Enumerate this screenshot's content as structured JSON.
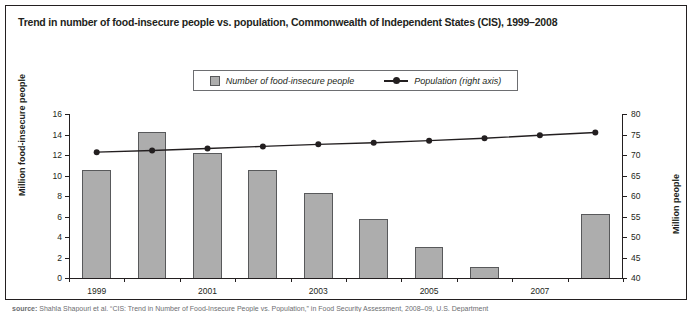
{
  "figure": {
    "title": "Trend in number of food-insecure people vs. population, Commonwealth of Independent States (CIS), 1999–2008",
    "source_prefix": "source:",
    "source_text": "Shahla Shapouri et al. “CIS: Trend in Number of Food-Insecure People vs. Population,” in Food Security Assessment, 2008–09, U.S. Department"
  },
  "legend": {
    "position": "top-center",
    "entries": [
      {
        "label": "Number of food-insecure people",
        "marker": "square-swatch",
        "color": "#adadad"
      },
      {
        "label": "Population (right axis)",
        "marker": "line-with-dot",
        "color": "#231f20"
      }
    ]
  },
  "axes": {
    "left": {
      "title": "Million food-insecure people",
      "ticks": [
        "0",
        "2",
        "4",
        "6",
        "8",
        "10",
        "12",
        "14",
        "16"
      ],
      "min": 0,
      "max": 16
    },
    "right": {
      "title": "Million people",
      "ticks": [
        "40",
        "45",
        "50",
        "55",
        "60",
        "65",
        "70",
        "75",
        "80"
      ],
      "min": 40,
      "max": 80
    },
    "x": {
      "tick_labels": [
        "1999",
        "2001",
        "2003",
        "2005",
        "2007"
      ]
    }
  },
  "chart_data": {
    "type": "bar",
    "title": "Trend in number of food-insecure people vs. population, Commonwealth of Independent States (CIS), 1999–2008",
    "xlabel": "",
    "ylabel": "Million food-insecure people",
    "y2label": "Million people",
    "ylim": [
      0,
      16
    ],
    "y2lim": [
      40,
      80
    ],
    "grid": false,
    "legend_position": "top-center",
    "categories": [
      "1999",
      "2000",
      "2001",
      "2002",
      "2003",
      "2004",
      "2005",
      "2006",
      "2007",
      "2008"
    ],
    "visible_tick_labels": [
      "1999",
      "",
      "2001",
      "",
      "2003",
      "",
      "2005",
      "",
      "2007",
      ""
    ],
    "series": [
      {
        "name": "Number of food-insecure people",
        "type": "bar",
        "axis": "left",
        "unit": "million people",
        "color": "#adadad",
        "edge_color": "#58595b",
        "values": [
          10.5,
          14.2,
          12.2,
          10.5,
          8.3,
          5.8,
          3.0,
          1.1,
          0.0,
          6.2
        ]
      },
      {
        "name": "Population (right axis)",
        "type": "line",
        "axis": "right",
        "unit": "million people",
        "color": "#231f20",
        "marker": "circle",
        "values": [
          70.7,
          71.1,
          71.6,
          72.1,
          72.6,
          73.0,
          73.5,
          74.1,
          74.8,
          75.5
        ]
      }
    ]
  }
}
